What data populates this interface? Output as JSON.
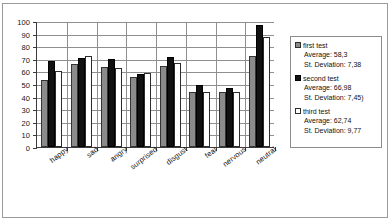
{
  "chart_data": {
    "type": "bar",
    "title": "",
    "xlabel": "",
    "ylabel": "",
    "ylim": [
      0,
      100
    ],
    "ytick_step": 10,
    "yticks": [
      100,
      90,
      80,
      70,
      60,
      50,
      40,
      30,
      20,
      10,
      0
    ],
    "grid": true,
    "legend_position": "right",
    "categories": [
      "happy",
      "sad",
      "angry",
      "surprised",
      "disgust",
      "fear",
      "nervous",
      "neutral"
    ],
    "series": [
      {
        "name": "first test",
        "color": "#8b8b8b",
        "average": "58,3",
        "st_deviation": "7,38",
        "values": [
          53,
          65.5,
          63.5,
          55.5,
          64,
          43.5,
          44,
          72.5
        ]
      },
      {
        "name": "second test",
        "color": "#111111",
        "average": "66,98",
        "st_deviation": "7,45",
        "values": [
          68,
          70.5,
          70,
          58,
          71.5,
          49.5,
          47,
          97
        ]
      },
      {
        "name": "third test",
        "color": "#ffffff",
        "average": "62,74",
        "st_deviation": "9,77",
        "values": [
          60.5,
          72,
          62.5,
          59,
          67,
          44,
          43.5,
          87.5
        ]
      }
    ]
  },
  "legend": {
    "entries": [
      {
        "label": "first test",
        "average_line": "Average: 58,3",
        "deviation_line": "St. Deviation: 7,38"
      },
      {
        "label": "second test",
        "average_line": "Average: 66,98",
        "deviation_line": "St. Deviation: 7,45)"
      },
      {
        "label": "third test",
        "average_line": "Average: 62,74",
        "deviation_line": "St. Deviation: 9,77"
      }
    ]
  }
}
